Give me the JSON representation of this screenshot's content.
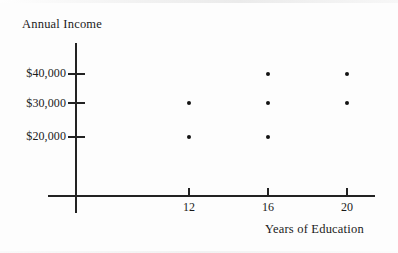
{
  "chart_data": {
    "type": "scatter",
    "title": "",
    "xlabel": "Years of Education",
    "ylabel": "Annual Income",
    "x_ticks": [
      12,
      16,
      20
    ],
    "x_tick_labels": [
      "12",
      "16",
      "20"
    ],
    "y_ticks": [
      20000,
      30000,
      40000
    ],
    "y_tick_labels": [
      "$20,000",
      "$30,000",
      "$40,000"
    ],
    "xlim": [
      8.5,
      22.5
    ],
    "ylim": [
      0,
      46000
    ],
    "grid": false,
    "legend": null,
    "points": [
      {
        "x": 12,
        "y": 30000
      },
      {
        "x": 12,
        "y": 20000
      },
      {
        "x": 16,
        "y": 40000
      },
      {
        "x": 16,
        "y": 30000
      },
      {
        "x": 16,
        "y": 20000
      },
      {
        "x": 20,
        "y": 40000
      },
      {
        "x": 20,
        "y": 30000
      }
    ],
    "marker": "dot",
    "marker_color": "#141414",
    "axis_color": "#222222",
    "background_color": "#fdfdfd"
  },
  "axes": {
    "y_title": "Annual Income",
    "x_title": "Years of Education"
  },
  "y_tick_labels": [
    {
      "text": "$40,000"
    },
    {
      "text": "$30,000"
    },
    {
      "text": "$20,000"
    }
  ],
  "x_tick_labels": [
    {
      "text": "12"
    },
    {
      "text": "16"
    },
    {
      "text": "20"
    }
  ]
}
